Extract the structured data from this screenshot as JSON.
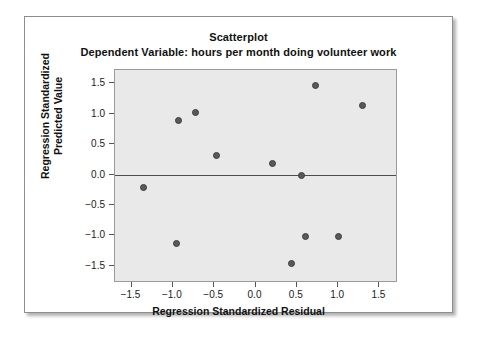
{
  "chart_data": {
    "type": "scatter",
    "title": "Scatterplot",
    "subtitle": "Dependent Variable: hours per month doing volunteer work",
    "xlabel": "Regression Standardized Residual",
    "ylabel_line1": "Regression Standardized",
    "ylabel_line2": "Predicted Value",
    "xlim": [
      -1.7,
      1.7
    ],
    "ylim": [
      -1.75,
      1.72
    ],
    "xticks": [
      -1.5,
      -1.0,
      -0.5,
      0.0,
      0.5,
      1.0,
      1.5
    ],
    "xticklabels": [
      "−1.5",
      "−1.0",
      "−0.5",
      "0.0",
      "0.5",
      "1.0",
      "1.5"
    ],
    "yticks": [
      1.5,
      1.0,
      0.5,
      0.0,
      -0.5,
      -1.0,
      -1.5
    ],
    "yticklabels": [
      "1.5",
      "1.0",
      "0.5",
      "0.0",
      "−0.5",
      "−1.0",
      "−1.5"
    ],
    "grid": false,
    "legend": "none",
    "reference_line": {
      "axis": "y",
      "value": 0.0,
      "color": "#4d4d4d"
    },
    "marker_color": "#595959",
    "panel_color": "#e9e9e9",
    "points": [
      {
        "x": -1.35,
        "y": -0.21
      },
      {
        "x": -0.96,
        "y": -1.13
      },
      {
        "x": -0.93,
        "y": 0.89
      },
      {
        "x": -0.73,
        "y": 1.02
      },
      {
        "x": -0.47,
        "y": 0.31
      },
      {
        "x": 0.2,
        "y": 0.19
      },
      {
        "x": 0.43,
        "y": -1.46
      },
      {
        "x": 0.56,
        "y": -0.01
      },
      {
        "x": 0.6,
        "y": -1.01
      },
      {
        "x": 0.72,
        "y": 1.46
      },
      {
        "x": 1.0,
        "y": -1.02
      },
      {
        "x": 1.3,
        "y": 1.14
      }
    ]
  }
}
